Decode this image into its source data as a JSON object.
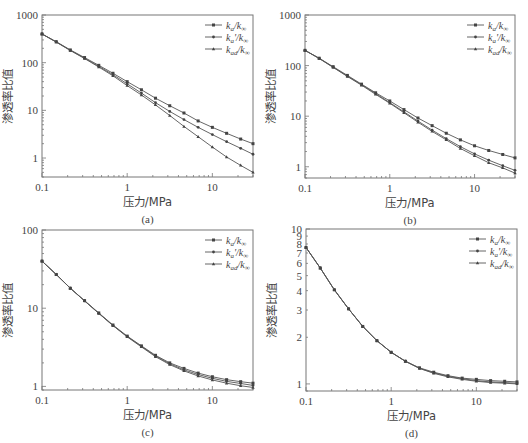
{
  "figure": {
    "ylabel": "渗透率比值",
    "xlabel": "压力/MPa",
    "legend": [
      "ka/k∞",
      "ka'/k∞",
      "kad/k∞"
    ],
    "legend_parts": [
      {
        "base": "k",
        "sub": "a",
        "prime": "",
        "den": "k",
        "den_sub": "∞"
      },
      {
        "base": "k",
        "sub": "a",
        "prime": "'",
        "den": "k",
        "den_sub": "∞"
      },
      {
        "base": "k",
        "sub": "ad",
        "prime": "",
        "den": "k",
        "den_sub": "∞"
      }
    ]
  },
  "chart_data": [
    {
      "panel": "(a)",
      "type": "line",
      "title": "",
      "xlabel": "压力/MPa",
      "ylabel": "渗透率比值",
      "xscale": "log",
      "yscale": "log",
      "xlim": [
        0.1,
        30
      ],
      "ylim": [
        0.4,
        1000
      ],
      "xticks": [
        "0.1",
        "1",
        "10"
      ],
      "yticks": [
        "1",
        "10",
        "100",
        "1000"
      ],
      "legend_position": "top-right",
      "x": [
        0.1,
        0.147,
        0.215,
        0.316,
        0.464,
        0.681,
        1,
        1.47,
        2.15,
        3.16,
        4.64,
        6.81,
        10,
        14.7,
        21.5,
        30
      ],
      "series": [
        {
          "name": "ka/k∞",
          "values": [
            400,
            275,
            185,
            128,
            88,
            60,
            40,
            27,
            18,
            12.5,
            8.8,
            6.0,
            4.4,
            3.3,
            2.5,
            2.0
          ]
        },
        {
          "name": "ka'/k∞",
          "values": [
            400,
            272,
            182,
            124,
            84,
            56,
            36,
            23,
            14.5,
            9.5,
            6.4,
            4.4,
            3.1,
            2.2,
            1.6,
            1.2
          ]
        },
        {
          "name": "kad/k∞",
          "values": [
            400,
            270,
            180,
            122,
            81,
            53,
            33,
            21,
            13,
            7.8,
            4.6,
            2.8,
            1.7,
            1.05,
            0.7,
            0.5
          ]
        }
      ],
      "caption": "(a)"
    },
    {
      "panel": "(b)",
      "type": "line",
      "title": "",
      "xlabel": "压力/MPa",
      "ylabel": "渗透率比值",
      "xscale": "log",
      "yscale": "log",
      "xlim": [
        0.1,
        30
      ],
      "ylim": [
        0.6,
        1000
      ],
      "xticks": [
        "0.1",
        "1",
        "10"
      ],
      "yticks": [
        "1",
        "10",
        "100",
        "1000"
      ],
      "legend_position": "top-right",
      "x": [
        0.1,
        0.147,
        0.215,
        0.316,
        0.464,
        0.681,
        1,
        1.47,
        2.15,
        3.16,
        4.64,
        6.81,
        10,
        14.7,
        21.5,
        30
      ],
      "series": [
        {
          "name": "ka/k∞",
          "values": [
            200,
            140,
            95,
            64,
            43,
            29,
            20,
            13.5,
            9.2,
            6.5,
            4.6,
            3.4,
            2.6,
            2.1,
            1.75,
            1.5
          ]
        },
        {
          "name": "ka'/k∞",
          "values": [
            200,
            139,
            93,
            62,
            42,
            28,
            18.5,
            12.2,
            8.0,
            5.3,
            3.6,
            2.5,
            1.8,
            1.35,
            1.05,
            0.85
          ]
        },
        {
          "name": "kad/k∞",
          "values": [
            200,
            138,
            92,
            61,
            41,
            27,
            18,
            11.7,
            7.6,
            5.0,
            3.4,
            2.3,
            1.65,
            1.2,
            0.95,
            0.75
          ]
        }
      ],
      "caption": "(b)"
    },
    {
      "panel": "(c)",
      "type": "line",
      "title": "",
      "xlabel": "压力/MPa",
      "ylabel": "渗透率比值",
      "xscale": "log",
      "yscale": "log",
      "xlim": [
        0.1,
        30
      ],
      "ylim": [
        0.9,
        100
      ],
      "xticks": [
        "0.1",
        "1",
        "10"
      ],
      "yticks": [
        "1",
        "10",
        "100"
      ],
      "legend_position": "top-right",
      "x": [
        0.1,
        0.147,
        0.215,
        0.316,
        0.464,
        0.681,
        1,
        1.47,
        2.15,
        3.16,
        4.64,
        6.81,
        10,
        14.7,
        21.5,
        30
      ],
      "series": [
        {
          "name": "ka/k∞",
          "values": [
            40,
            27,
            18,
            12.5,
            8.7,
            6.1,
            4.4,
            3.3,
            2.5,
            2.0,
            1.7,
            1.48,
            1.33,
            1.22,
            1.15,
            1.1
          ]
        },
        {
          "name": "ka'/k∞",
          "values": [
            40,
            27,
            18,
            12.4,
            8.6,
            6.0,
            4.35,
            3.25,
            2.45,
            1.95,
            1.63,
            1.42,
            1.27,
            1.16,
            1.09,
            1.03
          ]
        },
        {
          "name": "kad/k∞",
          "values": [
            40,
            27,
            18,
            12.4,
            8.6,
            6.0,
            4.3,
            3.2,
            2.4,
            1.9,
            1.58,
            1.36,
            1.21,
            1.1,
            1.02,
            0.97
          ]
        }
      ],
      "caption": "(c)"
    },
    {
      "panel": "(d)",
      "type": "line",
      "title": "",
      "xlabel": "压力/MPa",
      "ylabel": "渗透率比值",
      "xscale": "log",
      "yscale": "log",
      "xlim": [
        0.1,
        30
      ],
      "ylim": [
        0.9,
        10
      ],
      "xticks": [
        "0.1",
        "1",
        "10"
      ],
      "yticks": [
        "1",
        "2",
        "3",
        "4",
        "5",
        "6",
        "7",
        "8",
        "9",
        "10"
      ],
      "legend_position": "top-right",
      "x": [
        0.1,
        0.147,
        0.215,
        0.316,
        0.464,
        0.681,
        1,
        1.47,
        2.15,
        3.16,
        4.64,
        6.81,
        10,
        14.7,
        21.5,
        30
      ],
      "series": [
        {
          "name": "ka/k∞",
          "values": [
            7.6,
            5.6,
            4.05,
            3.05,
            2.35,
            1.9,
            1.6,
            1.4,
            1.27,
            1.19,
            1.13,
            1.09,
            1.07,
            1.05,
            1.04,
            1.03
          ]
        },
        {
          "name": "ka'/k∞",
          "values": [
            7.6,
            5.6,
            4.05,
            3.05,
            2.35,
            1.9,
            1.6,
            1.4,
            1.26,
            1.18,
            1.12,
            1.08,
            1.05,
            1.03,
            1.02,
            1.01
          ]
        },
        {
          "name": "kad/k∞",
          "values": [
            7.6,
            5.6,
            4.05,
            3.05,
            2.35,
            1.9,
            1.6,
            1.4,
            1.26,
            1.17,
            1.11,
            1.07,
            1.04,
            1.02,
            1.01,
            1.0
          ]
        }
      ],
      "caption": "(d)"
    }
  ],
  "layout": {
    "panels": [
      {
        "frame": [
          42,
          15,
          253,
          177
        ]
      },
      {
        "frame": [
          305,
          15,
          515,
          178
        ]
      },
      {
        "frame": [
          42,
          230,
          253,
          390
        ]
      },
      {
        "frame": [
          306,
          229,
          517,
          391
        ]
      }
    ],
    "colors": {
      "line": "#555555",
      "frame": "#777777",
      "marker": "#444444"
    }
  }
}
